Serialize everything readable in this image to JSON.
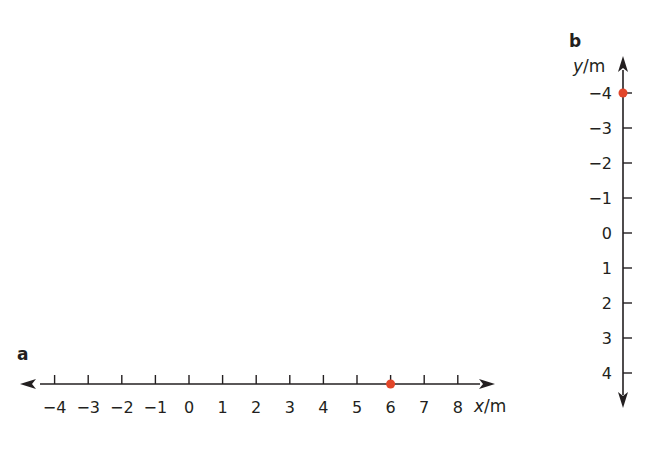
{
  "chart_data": [
    {
      "type": "scatter",
      "panel": "a",
      "orientation": "horizontal",
      "axis_label": "x/m",
      "axis_variable": "x",
      "axis_unit": "m",
      "ticks": [
        -4,
        -3,
        -2,
        -1,
        0,
        1,
        2,
        3,
        4,
        5,
        6,
        7,
        8
      ],
      "tick_labels": [
        "−4",
        "−3",
        "−2",
        "−1",
        "0",
        "1",
        "2",
        "3",
        "4",
        "5",
        "6",
        "7",
        "8"
      ],
      "points": [
        {
          "x": 6
        }
      ],
      "axis_range": [
        -4,
        8
      ],
      "arrows": "both ends",
      "grid": false,
      "point_color": "#e2462a"
    },
    {
      "type": "scatter",
      "panel": "b",
      "orientation": "vertical",
      "axis_label": "y/m",
      "axis_variable": "y",
      "axis_unit": "m",
      "ticks_top_to_bottom": [
        -4,
        -3,
        -2,
        -1,
        0,
        1,
        2,
        3,
        4
      ],
      "tick_labels": [
        "−4",
        "−3",
        "−2",
        "−1",
        "0",
        "1",
        "2",
        "3",
        "4"
      ],
      "points": [
        {
          "y": -4
        }
      ],
      "axis_range": [
        -4,
        4
      ],
      "arrows": "both ends",
      "grid": false,
      "point_color": "#e2462a"
    }
  ],
  "panels": {
    "a": {
      "label": "a",
      "unit_var": "x",
      "unit_rest": "/m"
    },
    "b": {
      "label": "b",
      "unit_var": "y",
      "unit_rest": "/m"
    }
  },
  "colors": {
    "axis": "#231f20",
    "point": "#e2462a"
  }
}
